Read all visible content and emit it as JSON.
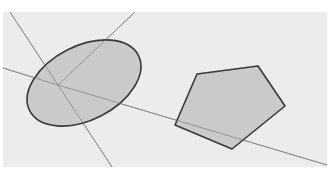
{
  "viewport": {
    "label": "3D modeling viewport",
    "background": "#ececec",
    "axes": {
      "origin": [
        55,
        73
      ],
      "color": "#9a9a9a",
      "lines": [
        {
          "name": "axis-up-left",
          "to": [
            7,
            0
          ]
        },
        {
          "name": "axis-up-right",
          "to": [
            132,
            0
          ]
        },
        {
          "name": "axis-left",
          "to": [
            0,
            56
          ]
        },
        {
          "name": "axis-down-right",
          "to": [
            324,
            153
          ]
        },
        {
          "name": "axis-down",
          "to": [
            109,
            155
          ]
        }
      ]
    },
    "shapes": [
      {
        "type": "ellipse",
        "label": "circle",
        "cx": 81,
        "cy": 71,
        "rx": 61,
        "ry": 37,
        "rotate": -27,
        "fill": "#c4c4c4",
        "stroke": "#3a3a3a"
      },
      {
        "type": "polygon",
        "label": "pentagon",
        "points": "194,62 255,54 282,94 229,137 172,113",
        "fill": "#c4c4c4",
        "stroke": "#3a3a3a"
      }
    ]
  }
}
